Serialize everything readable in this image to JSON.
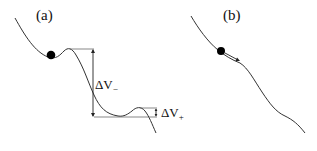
{
  "panels": [
    {
      "id": "a",
      "label": "(a)",
      "annotations": {
        "delta_v_minus": {
          "symbol": "ΔV",
          "subscript": "−"
        },
        "delta_v_plus": {
          "symbol": "ΔV",
          "subscript": "+"
        }
      },
      "description": "Potential curve with ball resting in a local minimum; large drop ΔV− and small barrier ΔV+"
    },
    {
      "id": "b",
      "label": "(b)",
      "description": "Potential curve with ball rolling down a slope, arrow indicating motion direction"
    }
  ],
  "colors": {
    "curve": "#333333",
    "ball": "#000000",
    "text": "#111111",
    "background": "#ffffff"
  }
}
